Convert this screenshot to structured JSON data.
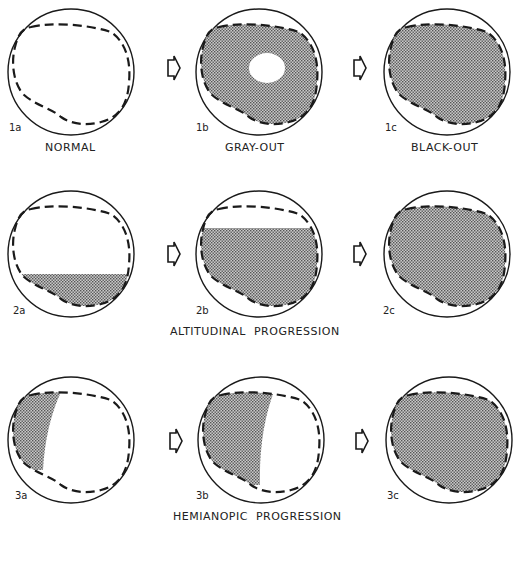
{
  "figure": {
    "rows": [
      {
        "title": "",
        "panels": [
          {
            "id": "1a",
            "label": "NORMAL"
          },
          {
            "id": "1b",
            "label": "GRAY-OUT"
          },
          {
            "id": "1c",
            "label": "BLACK-OUT"
          }
        ]
      },
      {
        "title": "ALTITUDINAL  PROGRESSION",
        "panels": [
          {
            "id": "2a",
            "label": ""
          },
          {
            "id": "2b",
            "label": ""
          },
          {
            "id": "2c",
            "label": ""
          }
        ]
      },
      {
        "title": "HEMIANOPIC  PROGRESSION",
        "panels": [
          {
            "id": "3a",
            "label": ""
          },
          {
            "id": "3b",
            "label": ""
          },
          {
            "id": "3c",
            "label": ""
          }
        ]
      }
    ],
    "arrow_icon": "outline-right-arrow-icon",
    "colors": {
      "ink": "#1a1a1a",
      "stipple": "#8a8a8a",
      "background": "#ffffff"
    }
  }
}
